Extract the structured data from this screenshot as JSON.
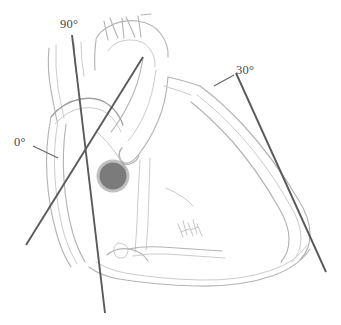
{
  "figure": {
    "type": "anatomical-line-drawing",
    "background_color": "#ffffff",
    "width": 341,
    "height": 325
  },
  "labels": {
    "angle_0": "0°",
    "angle_30": "30°",
    "angle_90": "90°"
  },
  "axes": [
    {
      "name": "plane-0-degrees",
      "label": "0°",
      "angle_degrees": 0,
      "stroke": "#5a5a5a",
      "x1": 26,
      "y1": 245,
      "x2": 143,
      "y2": 57
    },
    {
      "name": "plane-30-degrees",
      "label": "30°",
      "angle_degrees": 30,
      "stroke": "#5a5a5a",
      "x1": 236,
      "y1": 73,
      "x2": 326,
      "y2": 272
    },
    {
      "name": "plane-90-degrees",
      "label": "90°",
      "angle_degrees": 90,
      "stroke": "#5a5a5a",
      "x1": 72,
      "y1": 35,
      "x2": 105,
      "y2": 313
    }
  ],
  "pivot": {
    "name": "plane-origin-marker",
    "cx": 113,
    "cy": 176,
    "r": 14,
    "color": "#7b7b7b"
  },
  "palette": {
    "outline": "#b4b4b4",
    "outline_faint": "#cbcbcb",
    "outline_dark": "#a0a0a0",
    "axis": "#5a5a5a",
    "label_text": "#4a4a4a",
    "pivot": "#7b7b7b"
  }
}
